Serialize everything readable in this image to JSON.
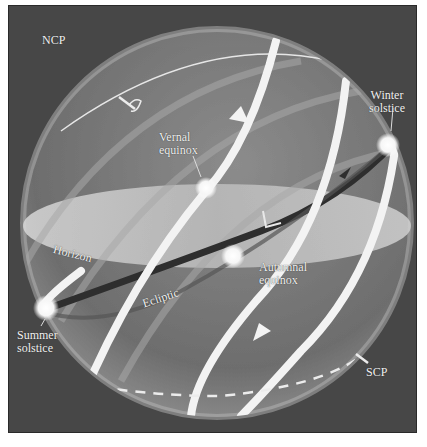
{
  "diagram": {
    "type": "celestial-sphere",
    "labels": {
      "ncp": "NCP",
      "scp": "SCP",
      "vernal_equinox": [
        "Vernal",
        "equinox"
      ],
      "autumnal_equinox": [
        "Autumnal",
        "equinox"
      ],
      "winter_solstice": [
        "Winter",
        "solstice"
      ],
      "summer_solstice": [
        "Summer",
        "solstice"
      ],
      "horizon": "Horizon",
      "ecliptic": "Ecliptic"
    },
    "colors": {
      "background": "#474747",
      "sphere": "#8a8a8a",
      "horizon_plane": "#cfcfcf",
      "sun_path": "#f4f4f4",
      "ecliptic": "#2e2e2e",
      "text": "#f2f2f2"
    }
  }
}
